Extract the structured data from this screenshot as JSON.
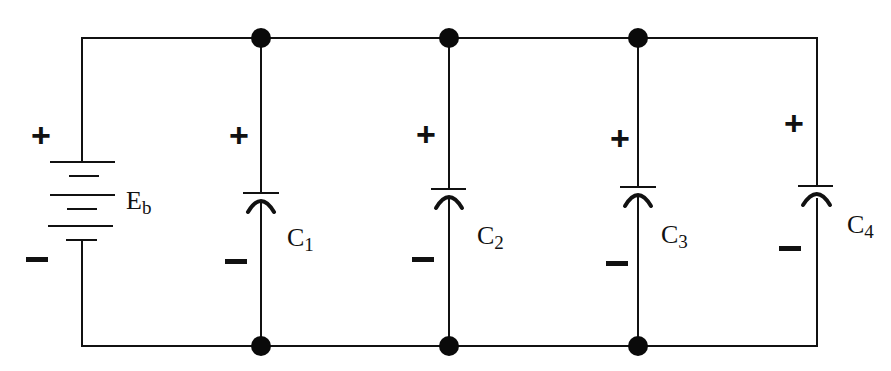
{
  "diagram": {
    "type": "parallel capacitor circuit",
    "source": {
      "label": "E",
      "subscript": "b",
      "plus": "+",
      "minus": "−"
    },
    "capacitors": [
      {
        "label": "C",
        "subscript": "1",
        "plus": "+",
        "minus": "−"
      },
      {
        "label": "C",
        "subscript": "2",
        "plus": "+",
        "minus": "−"
      },
      {
        "label": "C",
        "subscript": "3",
        "plus": "+",
        "minus": "−"
      },
      {
        "label": "C",
        "subscript": "4",
        "plus": "+",
        "minus": "−"
      }
    ],
    "nodes_count": 6,
    "colors": {
      "ink": "#111111",
      "background": "#ffffff"
    }
  }
}
